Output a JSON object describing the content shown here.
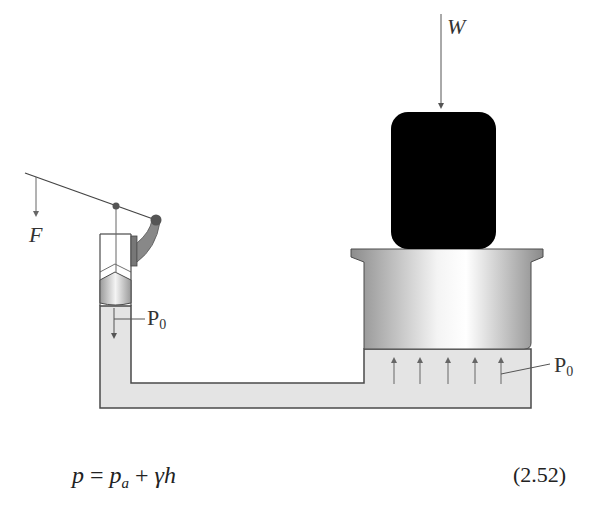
{
  "figure": {
    "labels": {
      "force": "F",
      "weight": "W",
      "pressure_left": {
        "main": "P",
        "sub": "0"
      },
      "pressure_right": {
        "main": "P",
        "sub": "0"
      }
    },
    "colors": {
      "fluid": "#e4e4e4",
      "outline": "#4a4a4a",
      "piston_dark": "#8c8c8c",
      "piston_light": "#f2f2f2",
      "load": "#000000",
      "arrow": "#666666"
    },
    "pressure_arrow_count": 5
  },
  "equation": {
    "lhs": "p",
    "equals": "=",
    "term1_main": "p",
    "term1_sub": "a",
    "plus": "+",
    "term2": "γh",
    "number": "(2.52)"
  }
}
